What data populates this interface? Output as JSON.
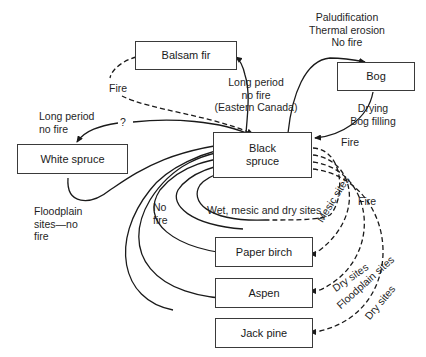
{
  "nodes": {
    "balsam_fir": "Balsam fir",
    "bog": "Bog",
    "white_spruce": "White spruce",
    "black_spruce_1": "Black",
    "black_spruce_2": "spruce",
    "paper_birch": "Paper birch",
    "aspen": "Aspen",
    "jack_pine": "Jack pine"
  },
  "labels": {
    "paludification": [
      "Paludification",
      "Thermal erosion",
      "No fire"
    ],
    "fire_balsam": "Fire",
    "long_period_eastern": [
      "Long period",
      "no fire",
      "(Eastern Canada)"
    ],
    "long_period_white": [
      "Long period",
      "no fire"
    ],
    "question": "?",
    "drying": [
      "Drying",
      "Bog filling"
    ],
    "fire_bog": "Fire",
    "floodplain_no_fire": [
      "Floodplain",
      "sites—no",
      "fire"
    ],
    "no_fire": [
      "No",
      "fire"
    ],
    "wet_mesic_dry": "Wet, mesic and dry sites",
    "fire_right": "Fire",
    "mesic_sites": "Mesic sites",
    "dry_sites_aspen": "Dry sites",
    "floodplain_sites": "Floodplain sites",
    "dry_sites_jack": "Dry sites"
  }
}
